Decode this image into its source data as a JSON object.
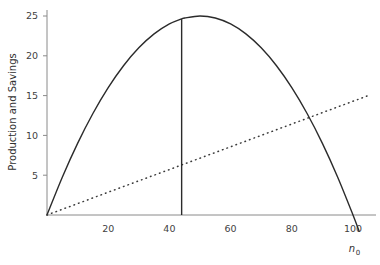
{
  "chart_data": {
    "type": "line",
    "title": "",
    "subtitle": "",
    "xlabel": "n0",
    "xlabel_base": "n",
    "xlabel_sub": "0",
    "ylabel": "Production and Savings",
    "xlim": [
      0,
      108
    ],
    "ylim": [
      0,
      26.5
    ],
    "grid": false,
    "legend": null,
    "xticks": [
      20,
      40,
      60,
      80,
      100
    ],
    "xtick_labels": [
      "20",
      "40",
      "60",
      "80",
      "100"
    ],
    "yticks": [
      5,
      10,
      15,
      20,
      25
    ],
    "ytick_labels": [
      "5",
      "10",
      "15",
      "20",
      "25"
    ],
    "series": [
      {
        "name": "Production",
        "style": "solid",
        "color": "#2b2b2b",
        "description": "Concave parabola y = n0*(100-n0)/100, peak 25 at n0 = 50, roots at 0 and 100",
        "x": [
          0,
          5,
          10,
          15,
          20,
          25,
          30,
          35,
          40,
          44,
          45,
          50,
          55,
          60,
          65,
          70,
          75,
          80,
          85,
          90,
          95,
          100,
          102
        ],
        "y": [
          0,
          4.75,
          9,
          12.75,
          16,
          18.75,
          21,
          22.75,
          24,
          24.64,
          24.75,
          25,
          24.75,
          24,
          22.75,
          21,
          18.75,
          16,
          12.75,
          9,
          4.75,
          0,
          -2.04
        ]
      },
      {
        "name": "Savings",
        "style": "dotted",
        "color": "#3a3a3a",
        "description": "Straight line through origin with slope about 0.143",
        "x": [
          0,
          10,
          20,
          30,
          40,
          44,
          50,
          60,
          70,
          80,
          87,
          90,
          100,
          105
        ],
        "y": [
          0,
          1.43,
          2.86,
          4.29,
          5.71,
          6.29,
          7.14,
          8.57,
          10.0,
          11.43,
          12.43,
          12.86,
          14.29,
          15.0
        ]
      }
    ],
    "annotations": [
      {
        "name": "optimum-vertical-line",
        "type": "vline",
        "x": 44,
        "y_bottom": 0,
        "y_top": 24.64,
        "color": "#2b2b2b"
      },
      {
        "name": "curve-intersection",
        "type": "point",
        "x": 87,
        "y": 12.43
      }
    ]
  },
  "axes": {
    "x_axis_color": "#8a8a8a",
    "y_axis_color": "#8a8a8a",
    "tick_color": "#8a8a8a"
  }
}
